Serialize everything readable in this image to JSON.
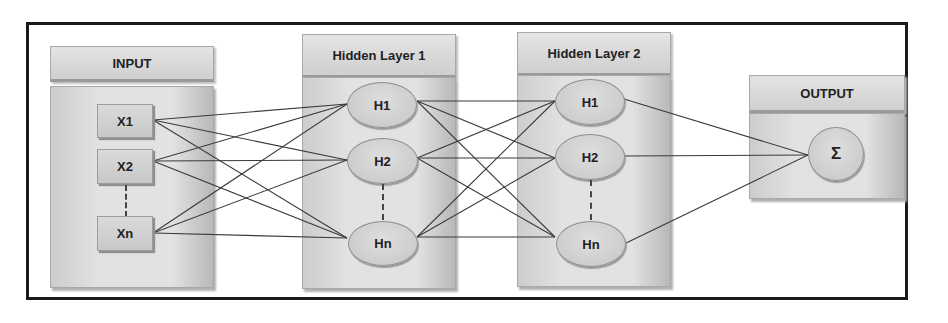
{
  "diagram": {
    "type": "neural-network-architecture",
    "layers": [
      {
        "id": "input",
        "title": "INPUT",
        "nodes": [
          "X1",
          "X2",
          "Xn"
        ],
        "node_shape": "box"
      },
      {
        "id": "hidden1",
        "title": "Hidden Layer 1",
        "nodes": [
          "H1",
          "H2",
          "Hn"
        ],
        "node_shape": "ellipse"
      },
      {
        "id": "hidden2",
        "title": "Hidden Layer 2",
        "nodes": [
          "H1",
          "H2",
          "Hn"
        ],
        "node_shape": "ellipse"
      },
      {
        "id": "output",
        "title": "OUTPUT",
        "nodes": [
          "Σ"
        ],
        "node_shape": "circle"
      }
    ],
    "connections": "fully-connected between adjacent layers",
    "ellipsis_between": "second and last node in input and hidden layers (dashed line)"
  },
  "colors": {
    "frame": "#1a1a1a",
    "panel": "#d8d8d8",
    "edge": "#3a3a3a"
  }
}
